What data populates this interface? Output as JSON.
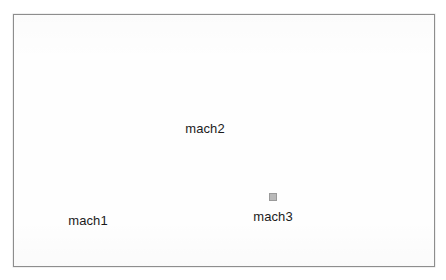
{
  "window": {
    "background_color": "#ffffff",
    "border_color": "#8d8d8d",
    "canvas_color": "#fefefe"
  },
  "canvas": {
    "node_fill_color": "#2e2e2e",
    "selection_frame_color": "#b9b9b9",
    "label_color": "#1b1b1b",
    "nodes": [
      {
        "id": "mach1",
        "label": "mach1",
        "icon": "machine-square-icon",
        "selected": false,
        "x": 55,
        "y": 176
      },
      {
        "id": "mach2",
        "label": "mach2",
        "icon": "machine-square-icon",
        "selected": false,
        "x": 172,
        "y": 84
      },
      {
        "id": "mach3",
        "label": "mach3",
        "icon": "machine-square-icon",
        "selected": true,
        "x": 240,
        "y": 172
      }
    ]
  }
}
